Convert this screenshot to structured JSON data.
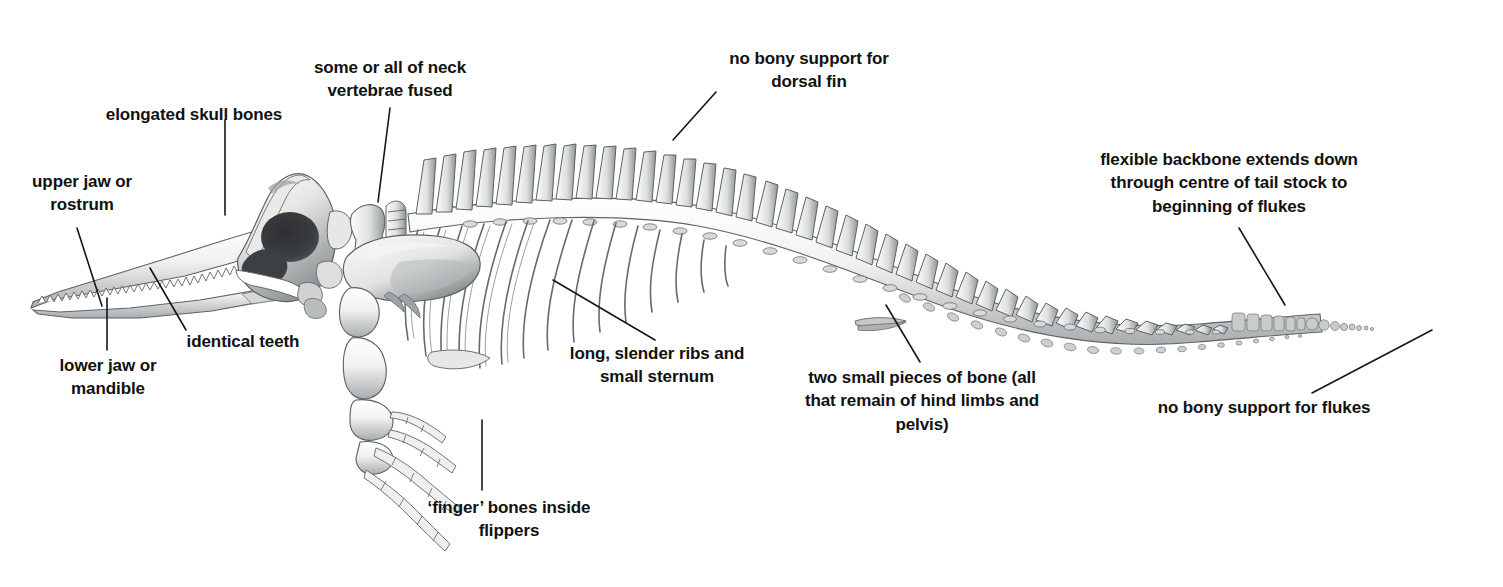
{
  "figure": {
    "background_color": "#ffffff",
    "ink_color": "#14161a",
    "bone_light": "#f4f4f2",
    "bone_mid": "#b9bcbd",
    "bone_dark": "#6f7477"
  },
  "labels": {
    "upper_jaw": "upper jaw or\nrostrum",
    "lower_jaw": "lower jaw or\nmandible",
    "identical_teeth": "identical teeth",
    "elongated_skull": "elongated skull bones",
    "neck_vertebrae": "some or all of neck\nvertebrae fused",
    "dorsal_fin": "no bony support for\ndorsal fin",
    "flexible_backbone": "flexible backbone extends down\nthrough centre of tail stock to\nbeginning of flukes",
    "ribs_sternum": "long, slender ribs and\nsmall sternum",
    "hind_limbs": "two small pieces of bone (all\nthat remain of hind limbs and\npelvis)",
    "finger_bones": "‘finger’ bones inside\nflippers",
    "flukes": "no bony support for flukes"
  },
  "anatomy_parts": [
    "rostrum",
    "mandible",
    "teeth",
    "cranium",
    "cervical-vertebrae",
    "thoracic-vertebrae",
    "ribs",
    "sternum",
    "scapula",
    "humerus",
    "radius-ulna",
    "carpals",
    "phalanges",
    "lumbar-vertebrae",
    "caudal-vertebrae",
    "chevron-bones",
    "vestigial-pelvis"
  ],
  "counts": {
    "ribs": 13,
    "vertebrae_visible": 52,
    "chevrons": 26
  }
}
